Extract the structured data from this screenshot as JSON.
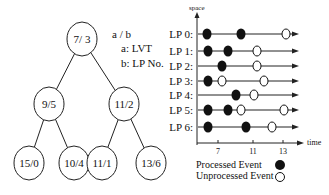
{
  "tree": {
    "legend": {
      "format": "a / b",
      "a": "a: LVT",
      "b": "b: LP No."
    },
    "nodes": [
      {
        "id": "root",
        "label": "7/ 3",
        "cx": 82,
        "cy": 39
      },
      {
        "id": "l",
        "label": "9/5",
        "cx": 49,
        "cy": 104
      },
      {
        "id": "r",
        "label": "11/2",
        "cx": 124,
        "cy": 104
      },
      {
        "id": "ll",
        "label": "15/0",
        "cx": 29,
        "cy": 163
      },
      {
        "id": "lr",
        "label": "10/4",
        "cx": 74,
        "cy": 163
      },
      {
        "id": "rl",
        "label": "11/1",
        "cx": 102,
        "cy": 163
      },
      {
        "id": "rr",
        "label": "13/6",
        "cx": 151,
        "cy": 163
      }
    ],
    "edges": [
      [
        "root",
        "l"
      ],
      [
        "root",
        "r"
      ],
      [
        "l",
        "ll"
      ],
      [
        "l",
        "lr"
      ],
      [
        "r",
        "rl"
      ],
      [
        "r",
        "rr"
      ]
    ]
  },
  "timeline": {
    "y_axis_label": "space",
    "x_axis_label": "time",
    "x_ticks": [
      {
        "label": "7",
        "x": 218
      },
      {
        "label": "11",
        "x": 253
      },
      {
        "label": "13",
        "x": 283
      }
    ],
    "rows": [
      {
        "label": "LP 0:",
        "y": 34,
        "events": [
          {
            "x": 207,
            "processed": true
          },
          {
            "x": 241,
            "processed": true
          },
          {
            "x": 286,
            "processed": false
          }
        ]
      },
      {
        "label": "LP 1:",
        "y": 51,
        "events": [
          {
            "x": 208,
            "processed": true
          },
          {
            "x": 228,
            "processed": true
          },
          {
            "x": 257,
            "processed": false
          }
        ]
      },
      {
        "label": "LP 2:",
        "y": 66,
        "events": [
          {
            "x": 222,
            "processed": true
          },
          {
            "x": 257,
            "processed": false
          }
        ]
      },
      {
        "label": "LP 3:",
        "y": 81,
        "events": [
          {
            "x": 208,
            "processed": true
          },
          {
            "x": 222,
            "processed": false
          },
          {
            "x": 264,
            "processed": false
          }
        ]
      },
      {
        "label": "LP 4:",
        "y": 95,
        "events": [
          {
            "x": 236,
            "processed": true
          },
          {
            "x": 254,
            "processed": false
          }
        ]
      },
      {
        "label": "LP 5:",
        "y": 110,
        "events": [
          {
            "x": 208,
            "processed": true
          },
          {
            "x": 228,
            "processed": true
          },
          {
            "x": 241,
            "processed": false
          },
          {
            "x": 284,
            "processed": false
          }
        ]
      },
      {
        "label": "LP 6:",
        "y": 127,
        "events": [
          {
            "x": 208,
            "processed": true
          },
          {
            "x": 246,
            "processed": true
          },
          {
            "x": 272,
            "processed": false
          }
        ]
      }
    ],
    "legend": {
      "processed": "Processed Event",
      "unprocessed": "Unprocessed Event"
    }
  }
}
